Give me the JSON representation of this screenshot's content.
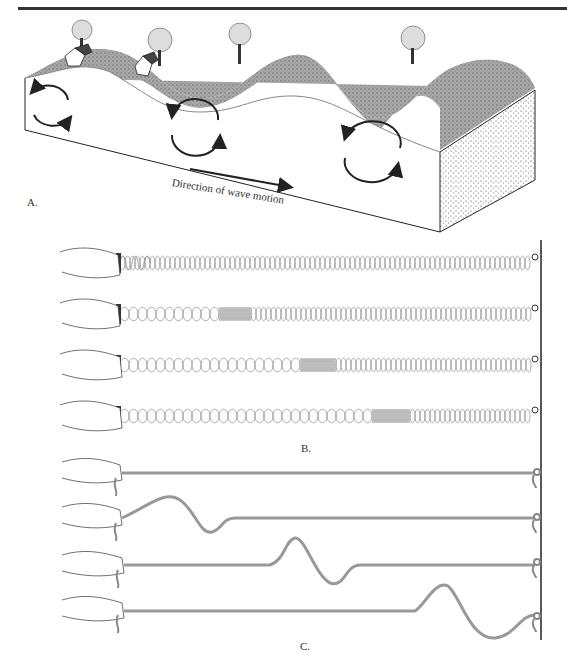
{
  "figure": {
    "panel_a": {
      "label": "A.",
      "caption": "Direction of wave motion",
      "elements": [
        "ground-block",
        "wave-surface",
        "trees",
        "houses",
        "circular-motion-arrows",
        "direction-arrow"
      ]
    },
    "panel_b": {
      "label": "B.",
      "rows": 4,
      "description": "Hand holding coiled spring attached to wall; compression pulse travels along spring"
    },
    "panel_c": {
      "label": "C.",
      "rows": 4,
      "description": "Hand holding rope attached to wall; transverse wave pulse travels along rope"
    }
  },
  "colors": {
    "ink": "#222222",
    "ground_fill": "#9a9a9a",
    "spring": "#888888",
    "rope": "#999999"
  }
}
